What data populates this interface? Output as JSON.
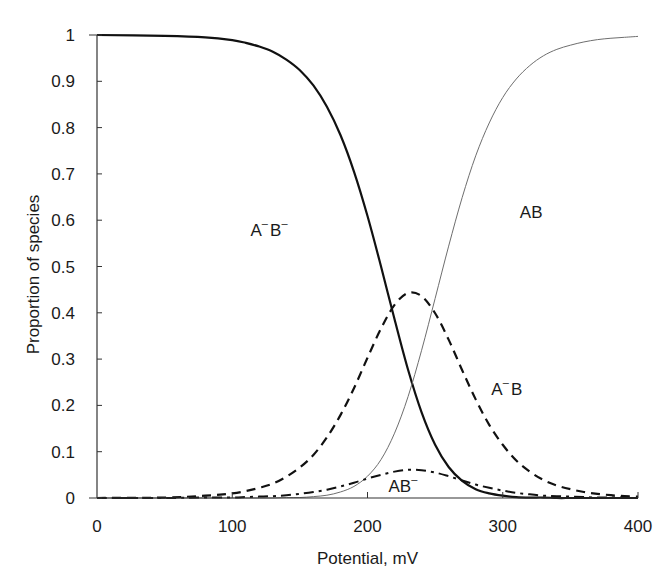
{
  "chart_data": {
    "type": "line",
    "title": "",
    "xlabel": "Potential, mV",
    "ylabel": "Proportion of species",
    "xlim": [
      0,
      400
    ],
    "ylim": [
      0,
      1
    ],
    "grid": false,
    "legend": "none (curves labelled inline)",
    "x_ticks": [
      0,
      100,
      200,
      300,
      400
    ],
    "x_tick_labels": [
      "0",
      "100",
      "200",
      "300",
      "400"
    ],
    "y_ticks": [
      0,
      0.1,
      0.2,
      0.3,
      0.4,
      0.5,
      0.6,
      0.7,
      0.8,
      0.9,
      1
    ],
    "y_tick_labels": [
      "0",
      "0.1",
      "0.2",
      "0.3",
      "0.4",
      "0.5",
      "0.6",
      "0.7",
      "0.8",
      "0.9",
      "1"
    ],
    "x": [
      0,
      50,
      80,
      100,
      110,
      120,
      130,
      140,
      150,
      160,
      170,
      180,
      190,
      200,
      210,
      220,
      230,
      240,
      250,
      260,
      270,
      280,
      290,
      300,
      310,
      320,
      330,
      340,
      350,
      360,
      370,
      380,
      390,
      400
    ],
    "series": [
      {
        "name": "A-B-",
        "label_base": [
          "A",
          "B"
        ],
        "label_sup": [
          "-",
          "-"
        ],
        "style": "solid-thick",
        "color": "#111111",
        "values": [
          1.0,
          0.998,
          0.995,
          0.989,
          0.983,
          0.975,
          0.964,
          0.947,
          0.924,
          0.891,
          0.845,
          0.784,
          0.705,
          0.609,
          0.5,
          0.386,
          0.277,
          0.185,
          0.115,
          0.067,
          0.037,
          0.019,
          0.01,
          0.005,
          0.002,
          0.001,
          0.001,
          0.0,
          0.0,
          0.0,
          0.0,
          0.0,
          0.0,
          0.0
        ]
      },
      {
        "name": "AB",
        "label_base": [
          "A",
          "B"
        ],
        "label_sup": [
          "",
          ""
        ],
        "style": "solid-thin",
        "color": "#6e6e6e",
        "values": [
          0.0,
          0.0,
          0.0,
          0.0,
          0.0,
          0.0,
          0.0,
          0.001,
          0.001,
          0.003,
          0.006,
          0.013,
          0.025,
          0.047,
          0.083,
          0.14,
          0.219,
          0.319,
          0.431,
          0.544,
          0.649,
          0.739,
          0.81,
          0.865,
          0.905,
          0.934,
          0.955,
          0.969,
          0.978,
          0.985,
          0.99,
          0.993,
          0.995,
          0.997
        ]
      },
      {
        "name": "A-B",
        "label_base": [
          "A",
          "B"
        ],
        "label_sup": [
          "-",
          ""
        ],
        "style": "dashed",
        "color": "#111111",
        "values": [
          0.0,
          0.001,
          0.005,
          0.01,
          0.015,
          0.022,
          0.031,
          0.046,
          0.066,
          0.093,
          0.131,
          0.179,
          0.237,
          0.303,
          0.366,
          0.417,
          0.443,
          0.436,
          0.399,
          0.342,
          0.276,
          0.213,
          0.158,
          0.115,
          0.081,
          0.057,
          0.039,
          0.027,
          0.019,
          0.013,
          0.009,
          0.006,
          0.004,
          0.003
        ]
      },
      {
        "name": "AB-",
        "label_base": [
          "A",
          "B"
        ],
        "label_sup": [
          "",
          "-"
        ],
        "style": "dash-dot",
        "color": "#111111",
        "values": [
          0.0,
          0.0,
          0.001,
          0.001,
          0.002,
          0.003,
          0.004,
          0.006,
          0.009,
          0.013,
          0.018,
          0.025,
          0.033,
          0.042,
          0.05,
          0.057,
          0.061,
          0.06,
          0.055,
          0.047,
          0.038,
          0.029,
          0.022,
          0.016,
          0.011,
          0.008,
          0.005,
          0.004,
          0.003,
          0.002,
          0.001,
          0.001,
          0.001,
          0.0
        ]
      }
    ],
    "annotations": [
      {
        "series": "A-B-",
        "text": "A-B-",
        "at_x": 128,
        "at_y": 0.565
      },
      {
        "series": "AB",
        "text": "AB",
        "at_x": 321,
        "at_y": 0.605
      },
      {
        "series": "A-B",
        "text": "A-B",
        "at_x": 303,
        "at_y": 0.222
      },
      {
        "series": "AB-",
        "text": "AB-",
        "at_x": 227,
        "at_y": 0.013
      }
    ]
  }
}
